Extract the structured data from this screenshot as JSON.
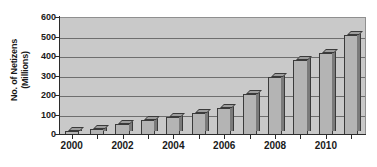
{
  "chart_data": {
    "type": "bar",
    "title": "",
    "subtitle": "",
    "xlabel": "",
    "ylabel": "No. of Netizens (Millions)",
    "ylabel_lines": [
      "No. of Netizens",
      "(Millions)"
    ],
    "categories": [
      "2000",
      "2001",
      "2002",
      "2003",
      "2004",
      "2005",
      "2006",
      "2007",
      "2008",
      "2009",
      "2010",
      "2011"
    ],
    "values": [
      22,
      33,
      59,
      79,
      94,
      111,
      137,
      210,
      298,
      384,
      420,
      513
    ],
    "ylim": [
      0,
      600
    ],
    "ytick_values": [
      0,
      100,
      200,
      300,
      400,
      500,
      600
    ],
    "ytick_labels": [
      "0",
      "100",
      "200",
      "300",
      "400",
      "500",
      "600"
    ],
    "xtick_labels": [
      "2000",
      "2002",
      "2004",
      "2006",
      "2008",
      "2010"
    ],
    "xtick_categories": [
      "2000",
      "2002",
      "2004",
      "2006",
      "2008",
      "2010"
    ],
    "grid": "horizontal",
    "legend": "none",
    "bar_style": "3d-column",
    "colors": {
      "bar_face": "#b4b4b4",
      "bar_top": "#9d9d9d",
      "bar_side": "#7a7a7a",
      "bar_edge": "#3a3a3a",
      "plot_background": "#c9c9c9",
      "gridline": "#6e6e6e",
      "axis": "#2b2b2b",
      "text": "#1a1a1a",
      "figure_background": "#ffffff"
    }
  }
}
